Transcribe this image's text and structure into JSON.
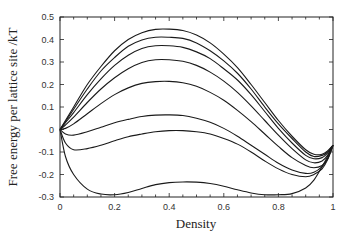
{
  "chart_data": {
    "type": "line",
    "title": "",
    "xlabel": "Density",
    "ylabel": "Free energy per lattice site /kT",
    "xlim": [
      0,
      1
    ],
    "ylim": [
      -0.3,
      0.5
    ],
    "xticks": [
      0,
      0.2,
      0.4,
      0.6,
      0.8,
      1
    ],
    "xtick_labels": [
      "0",
      "0.2",
      "0.4",
      "0.6",
      "0.8",
      "1"
    ],
    "yticks": [
      -0.3,
      -0.2,
      -0.1,
      0,
      0.1,
      0.2,
      0.3,
      0.4,
      0.5
    ],
    "ytick_labels": [
      "-0.3",
      "-0.2",
      "-0.1",
      "0",
      "0.1",
      "0.2",
      "0.3",
      "0.4",
      "0.5"
    ],
    "grid": false,
    "legend": "none",
    "x": [
      0,
      0.02,
      0.05,
      0.1,
      0.15,
      0.2,
      0.25,
      0.3,
      0.35,
      0.4,
      0.45,
      0.5,
      0.55,
      0.6,
      0.65,
      0.7,
      0.75,
      0.8,
      0.85,
      0.9,
      0.93,
      0.96,
      0.98,
      1
    ],
    "series": [
      {
        "name": "curve-1",
        "values": [
          0,
          0.04,
          0.1,
          0.2,
          0.28,
          0.35,
          0.4,
          0.43,
          0.445,
          0.446,
          0.44,
          0.42,
          0.385,
          0.335,
          0.275,
          0.2,
          0.12,
          0.04,
          -0.03,
          -0.09,
          -0.11,
          -0.11,
          -0.095,
          -0.07
        ]
      },
      {
        "name": "curve-2",
        "values": [
          0,
          0.035,
          0.09,
          0.18,
          0.26,
          0.32,
          0.37,
          0.398,
          0.41,
          0.41,
          0.405,
          0.385,
          0.35,
          0.305,
          0.25,
          0.18,
          0.1,
          0.025,
          -0.04,
          -0.1,
          -0.12,
          -0.115,
          -0.1,
          -0.07
        ]
      },
      {
        "name": "curve-3",
        "values": [
          0,
          0.03,
          0.075,
          0.155,
          0.225,
          0.285,
          0.33,
          0.36,
          0.372,
          0.372,
          0.365,
          0.345,
          0.315,
          0.27,
          0.22,
          0.155,
          0.08,
          0.005,
          -0.06,
          -0.115,
          -0.13,
          -0.125,
          -0.105,
          -0.07
        ]
      },
      {
        "name": "curve-4",
        "values": [
          0,
          0.02,
          0.055,
          0.12,
          0.18,
          0.23,
          0.27,
          0.298,
          0.31,
          0.31,
          0.303,
          0.285,
          0.255,
          0.215,
          0.165,
          0.105,
          0.04,
          -0.025,
          -0.085,
          -0.135,
          -0.148,
          -0.14,
          -0.115,
          -0.07
        ]
      },
      {
        "name": "curve-5",
        "values": [
          0,
          0.005,
          0.025,
          0.07,
          0.115,
          0.155,
          0.185,
          0.205,
          0.213,
          0.214,
          0.208,
          0.192,
          0.165,
          0.13,
          0.085,
          0.035,
          -0.02,
          -0.075,
          -0.125,
          -0.16,
          -0.17,
          -0.16,
          -0.13,
          -0.07
        ]
      },
      {
        "name": "curve-6",
        "values": [
          0,
          -0.02,
          -0.025,
          -0.01,
          0.01,
          0.03,
          0.045,
          0.058,
          0.064,
          0.065,
          0.062,
          0.05,
          0.032,
          0.005,
          -0.03,
          -0.07,
          -0.11,
          -0.15,
          -0.18,
          -0.195,
          -0.19,
          -0.165,
          -0.13,
          -0.07
        ]
      },
      {
        "name": "curve-7",
        "values": [
          0,
          -0.06,
          -0.09,
          -0.085,
          -0.07,
          -0.05,
          -0.032,
          -0.02,
          -0.01,
          -0.005,
          -0.005,
          -0.01,
          -0.02,
          -0.04,
          -0.065,
          -0.1,
          -0.14,
          -0.175,
          -0.2,
          -0.21,
          -0.2,
          -0.175,
          -0.135,
          -0.07
        ]
      },
      {
        "name": "curve-8",
        "values": [
          0,
          -0.12,
          -0.2,
          -0.265,
          -0.287,
          -0.29,
          -0.28,
          -0.262,
          -0.245,
          -0.236,
          -0.233,
          -0.234,
          -0.24,
          -0.252,
          -0.268,
          -0.282,
          -0.29,
          -0.29,
          -0.285,
          -0.26,
          -0.225,
          -0.165,
          -0.12,
          -0.07
        ]
      }
    ]
  },
  "plot_area": {
    "left": 60,
    "top": 17,
    "right": 333,
    "bottom": 197
  },
  "colors": {
    "line": "#1a1a1a",
    "frame": "#222222",
    "background": "#ffffff"
  }
}
